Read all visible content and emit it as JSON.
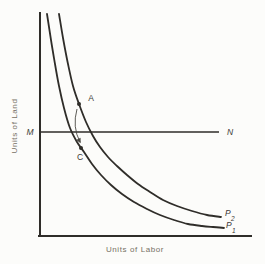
{
  "figure": {
    "bg_color": "#fcfcfa",
    "ink_color": "#2f2d29",
    "arrow_color": "#4a4843",
    "axis_text_color": "#767064",
    "label_color": "#3c3a35"
  },
  "chart_data": {
    "type": "line",
    "xlabel": "Units of Labor",
    "ylabel": "Units of Land",
    "axes": {
      "origin_x": 40,
      "origin_y": 236,
      "x_end": 251,
      "y_top": 13
    },
    "horizontal_line": {
      "left_label": "M",
      "right_label": "N",
      "y": 132,
      "x1": 41,
      "x2": 219,
      "m_x": 30,
      "m_y": 135,
      "n_x": 230,
      "n_y": 135
    },
    "curves": [
      {
        "name": "P2",
        "label": "P",
        "subscript": "2",
        "label_x": 225,
        "label_y": 216,
        "points": [
          [
            59,
            14
          ],
          [
            63,
            38
          ],
          [
            68,
            64
          ],
          [
            73,
            86
          ],
          [
            79,
            104
          ],
          [
            86,
            122
          ],
          [
            93,
            136
          ],
          [
            100,
            147
          ],
          [
            108,
            157
          ],
          [
            117,
            166
          ],
          [
            127,
            175
          ],
          [
            138,
            184
          ],
          [
            150,
            192
          ],
          [
            163,
            200
          ],
          [
            177,
            206
          ],
          [
            192,
            211
          ],
          [
            207,
            215
          ],
          [
            221,
            217
          ]
        ]
      },
      {
        "name": "P1",
        "label": "P",
        "subscript": "1",
        "label_x": 226,
        "label_y": 228,
        "points": [
          [
            47,
            14
          ],
          [
            51,
            40
          ],
          [
            55,
            64
          ],
          [
            59,
            86
          ],
          [
            64,
            108
          ],
          [
            70,
            128
          ],
          [
            77,
            142
          ],
          [
            84,
            152
          ],
          [
            92,
            164
          ],
          [
            101,
            175
          ],
          [
            111,
            185
          ],
          [
            122,
            194
          ],
          [
            134,
            202
          ],
          [
            147,
            209
          ],
          [
            160,
            215
          ],
          [
            174,
            220
          ],
          [
            188,
            224
          ],
          [
            202,
            226
          ],
          [
            213,
            227
          ],
          [
            224,
            228
          ]
        ]
      }
    ],
    "marked_points": [
      {
        "label": "A",
        "x": 79,
        "y": 104,
        "label_x": 91,
        "label_y": 101
      },
      {
        "label": "C",
        "x": 81,
        "y": 148,
        "label_x": 80,
        "label_y": 160
      }
    ],
    "arrow": {
      "from": [
        77,
        109
      ],
      "control": [
        72,
        127
      ],
      "to": [
        80,
        142
      ]
    },
    "x_label_x": 135,
    "x_label_y": 252,
    "y_label_x": 14,
    "y_label_y": 126
  }
}
